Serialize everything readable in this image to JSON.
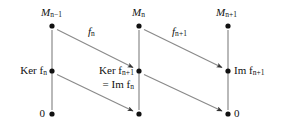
{
  "diagram": {
    "type": "commutative-diagram",
    "title": "",
    "background_color": "#ffffff",
    "line_color": "#8a8a8a",
    "node_color": "#111111",
    "text_color": "#111111",
    "columns": [
      {
        "id": "col-left",
        "x": 52
      },
      {
        "id": "col-middle",
        "x": 139
      },
      {
        "id": "col-right",
        "x": 228
      }
    ],
    "rows": [
      {
        "id": "row-top",
        "y": 26
      },
      {
        "id": "row-middle",
        "y": 71
      },
      {
        "id": "row-bottom",
        "y": 114
      }
    ],
    "nodes": [
      {
        "id": "node-top-left",
        "x": 52,
        "y": 26,
        "label_main": "M",
        "label_sub": "n−1",
        "label_extra": "",
        "label_position": "above",
        "italic_main": true
      },
      {
        "id": "node-top-middle",
        "x": 139,
        "y": 26,
        "label_main": "M",
        "label_sub": "n",
        "label_extra": "",
        "label_position": "above",
        "italic_main": true
      },
      {
        "id": "node-top-right",
        "x": 228,
        "y": 26,
        "label_main": "M",
        "label_sub": "n+1",
        "label_extra": "",
        "label_position": "above",
        "italic_main": true
      },
      {
        "id": "node-mid-left",
        "x": 52,
        "y": 71,
        "label_main": "Ker f",
        "label_sub": "n",
        "label_extra": "",
        "label_position": "left",
        "italic_main": false
      },
      {
        "id": "node-mid-middle",
        "x": 139,
        "y": 71,
        "label_main": "Ker f",
        "label_sub": "n+1",
        "label_extra": "= Im f",
        "label_extra_sub": "n",
        "label_position": "left",
        "italic_main": false
      },
      {
        "id": "node-mid-right",
        "x": 228,
        "y": 71,
        "label_main": "Im f",
        "label_sub": "n+1",
        "label_extra": "",
        "label_position": "right",
        "italic_main": false
      },
      {
        "id": "node-bottom-left",
        "x": 52,
        "y": 114,
        "label_main": "0",
        "label_sub": "",
        "label_extra": "",
        "label_position": "left",
        "italic_main": false
      },
      {
        "id": "node-bottom-middle",
        "x": 139,
        "y": 114,
        "label_main": "",
        "label_sub": "",
        "label_extra": "",
        "label_position": "none",
        "italic_main": false
      },
      {
        "id": "node-bottom-right",
        "x": 228,
        "y": 114,
        "label_main": "0",
        "label_sub": "",
        "label_extra": "",
        "label_position": "right",
        "italic_main": false
      }
    ],
    "vertical_edges": [
      {
        "id": "edge-v-left",
        "x": 52,
        "y1": 26,
        "y2": 114,
        "arrowhead": false
      },
      {
        "id": "edge-v-middle",
        "x": 139,
        "y1": 26,
        "y2": 114,
        "arrowhead": false
      },
      {
        "id": "edge-v-right",
        "x": 228,
        "y1": 26,
        "y2": 114,
        "arrowhead": false
      }
    ],
    "diagonal_edges": [
      {
        "id": "edge-fn",
        "from": "node-top-left",
        "to": "node-mid-middle",
        "x1": 57,
        "y1": 29,
        "x2": 134,
        "y2": 68,
        "arrowhead": true,
        "label_main": "f",
        "label_sub": "n",
        "label_x": 93,
        "label_y": 33
      },
      {
        "id": "edge-fn1",
        "from": "node-top-middle",
        "to": "node-mid-right",
        "x1": 144,
        "y1": 29,
        "x2": 223,
        "y2": 68,
        "arrowhead": true,
        "label_main": "f",
        "label_sub": "n+1",
        "label_x": 178,
        "label_y": 33
      },
      {
        "id": "edge-lower-left",
        "from": "node-mid-left",
        "to": "node-bottom-middle",
        "x1": 57,
        "y1": 74,
        "x2": 134,
        "y2": 111,
        "arrowhead": true,
        "label_main": "",
        "label_sub": "",
        "label_x": 0,
        "label_y": 0
      },
      {
        "id": "edge-lower-right",
        "from": "node-mid-middle",
        "to": "node-bottom-right",
        "x1": 144,
        "y1": 74,
        "x2": 223,
        "y2": 111,
        "arrowhead": true,
        "label_main": "",
        "label_sub": "",
        "label_x": 0,
        "label_y": 0
      }
    ]
  }
}
